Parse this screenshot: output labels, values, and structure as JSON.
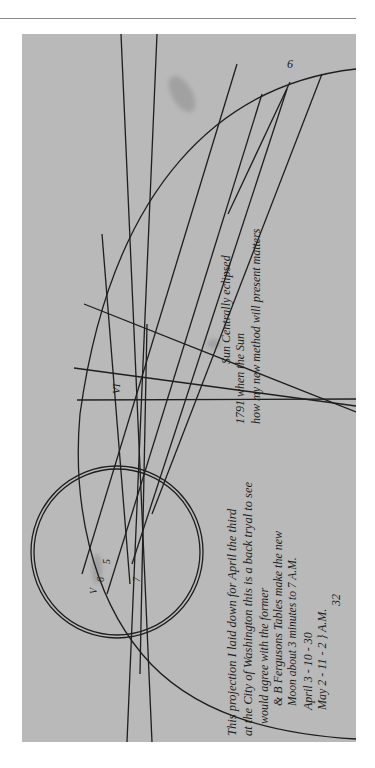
{
  "document": {
    "type": "Manuscript eclipse projection diagram (photograph, rotated 90°)",
    "colors": {
      "paper": "#b9b9b9",
      "ink": "#1e1e1e",
      "background": "#ffffff",
      "rule": "#8a8a8a"
    },
    "diagram_labels": {
      "top_arc_number": "6",
      "roman_hour": "VI",
      "circle_label_v": "V",
      "circle_label_6": "6",
      "circle_label_5": "5",
      "circle_label_7": "7"
    },
    "note_upper": {
      "line1": "Sun Centrally eclipsed",
      "line2": "1791 when the Sun",
      "line3": "how my new method will present matters"
    },
    "note_lower": {
      "line1": "This projection I laid down for April the third",
      "line2": "at the City of Washington this is a back tryal to see",
      "line3": "would agree with the former",
      "line4": "& B Fergusons Tables make the new",
      "line5": "Moon about 3 minutes to 7 A.M.",
      "line6": "April 3 - 10 - 30",
      "line7": "May 2 - 11 - 2   } A.M.",
      "line8": "32"
    }
  }
}
